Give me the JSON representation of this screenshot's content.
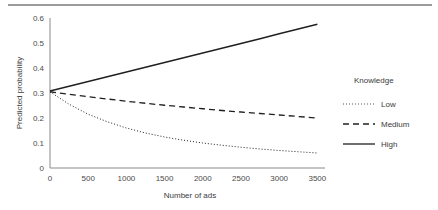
{
  "figure": {
    "name": "predicted-probability-by-number-of-ads"
  },
  "chart_data": {
    "type": "line",
    "title": "",
    "xlabel": "Number of ads",
    "ylabel": "Predicted probability",
    "xlim": [
      0,
      3600
    ],
    "ylim": [
      0,
      0.6
    ],
    "grid": false,
    "legend": {
      "position": "right",
      "title": "Knowledge",
      "entries": [
        {
          "name": "Low",
          "style": "dotted"
        },
        {
          "name": "Medium",
          "style": "dashed"
        },
        {
          "name": "High",
          "style": "solid"
        }
      ]
    },
    "xticks": [
      0,
      500,
      1000,
      1500,
      2000,
      2500,
      3000,
      3500
    ],
    "xticklabels": [
      "0",
      "500",
      "1000",
      "1500",
      "2000",
      "2500",
      "3000",
      "3500"
    ],
    "yticks": [
      0,
      0.1,
      0.2,
      0.3,
      0.4,
      0.5,
      0.6
    ],
    "yticklabels": [
      "0",
      "0.1",
      "0.2",
      "0.3",
      "0.4",
      "0.5",
      "0.6"
    ],
    "x": [
      0,
      250,
      500,
      750,
      1000,
      1250,
      1500,
      1750,
      2000,
      2250,
      2500,
      2750,
      3000,
      3250,
      3500
    ],
    "series": [
      {
        "name": "Low",
        "style": "dotted",
        "color": "#555555",
        "values": [
          0.305,
          0.255,
          0.215,
          0.185,
          0.16,
          0.14,
          0.124,
          0.111,
          0.1,
          0.091,
          0.083,
          0.076,
          0.07,
          0.065,
          0.06
        ]
      },
      {
        "name": "Medium",
        "style": "dashed",
        "color": "#1f1f1f",
        "values": [
          0.305,
          0.295,
          0.285,
          0.276,
          0.267,
          0.259,
          0.251,
          0.244,
          0.237,
          0.23,
          0.224,
          0.218,
          0.212,
          0.206,
          0.2
        ]
      },
      {
        "name": "High",
        "style": "solid",
        "color": "#1f1f1f",
        "values": [
          0.308,
          0.327,
          0.346,
          0.365,
          0.384,
          0.403,
          0.422,
          0.441,
          0.46,
          0.479,
          0.498,
          0.517,
          0.537,
          0.556,
          0.575
        ]
      }
    ]
  },
  "colors": {
    "axis": "#8a8a8a",
    "text": "#3b3b3b",
    "rule": "#9b9b9b"
  }
}
